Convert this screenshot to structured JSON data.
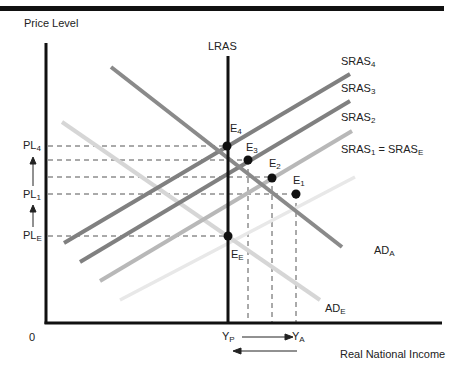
{
  "diagram": {
    "y_axis_label": "Price Level",
    "x_axis_label": "Real National Income",
    "origin_label": "0",
    "curves": {
      "lras": "LRAS",
      "sras4": {
        "base": "SRAS",
        "sub": "4"
      },
      "sras3": {
        "base": "SRAS",
        "sub": "3"
      },
      "sras2": {
        "base": "SRAS",
        "sub": "2"
      },
      "sras1": {
        "base": "SRAS",
        "sub": "1",
        "eq": " = SRAS",
        "eq_sub": "E"
      },
      "ad_a": {
        "base": "AD",
        "sub": "A"
      },
      "ad_e": {
        "base": "AD",
        "sub": "E"
      }
    },
    "points": {
      "e4": {
        "base": "E",
        "sub": "4"
      },
      "e3": {
        "base": "E",
        "sub": "3"
      },
      "e2": {
        "base": "E",
        "sub": "2"
      },
      "e1": {
        "base": "E",
        "sub": "1"
      },
      "ee": {
        "base": "E",
        "sub": "E"
      }
    },
    "price_levels": {
      "pl4": {
        "base": "PL",
        "sub": "4"
      },
      "pl1": {
        "base": "PL",
        "sub": "1"
      },
      "ple": {
        "base": "PL",
        "sub": "E"
      }
    },
    "income_levels": {
      "yp": {
        "base": "Y",
        "sub": "P"
      },
      "ya": {
        "base": "Y",
        "sub": "A"
      }
    },
    "colors": {
      "axis": "#111111",
      "sras_dark": "#808080",
      "sras2": "#b5b5b5",
      "sras1": "#e6e6e6",
      "ad_a": "#8a8a8a",
      "ad_e": "#d6d6d6"
    }
  }
}
